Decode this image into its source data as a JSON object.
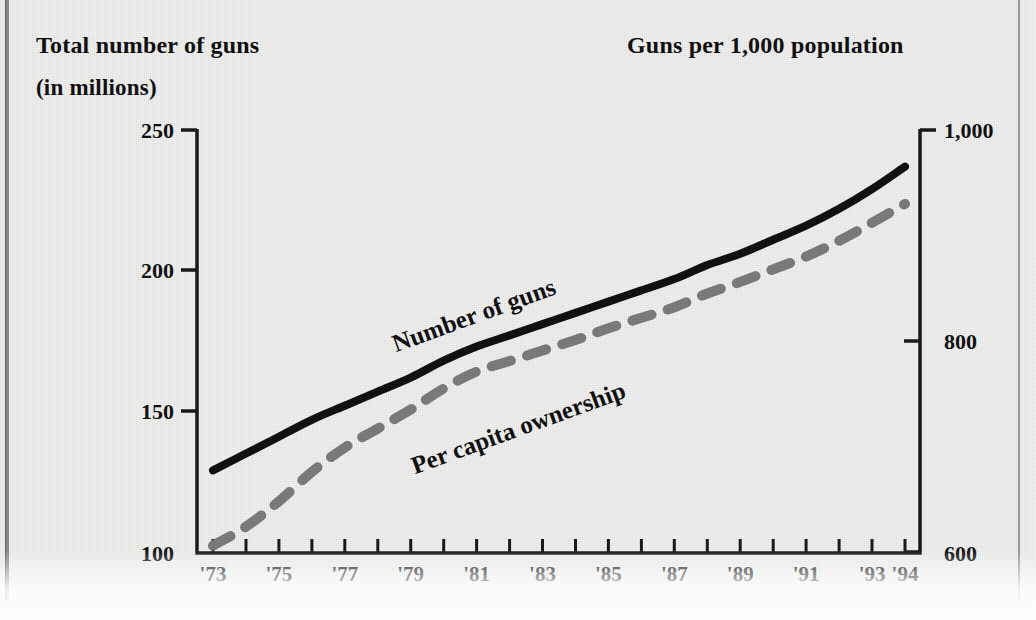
{
  "titles": {
    "left_line1": "Total number of guns",
    "left_line2": "(in millions)",
    "right": "Guns per 1,000 population"
  },
  "axes": {
    "left_ticks": [
      "250",
      "200",
      "150",
      "100"
    ],
    "right_ticks": [
      "1,000",
      "800",
      "600"
    ],
    "x_ticks": [
      "'73",
      "'75",
      "'77",
      "'79",
      "'81",
      "'83",
      "'85",
      "'87",
      "'89",
      "'91",
      "'93",
      "'94"
    ]
  },
  "series_labels": {
    "guns": "Number of guns",
    "per_capita": "Per capita ownership"
  },
  "colors": {
    "guns_line": "#111111",
    "per_capita_line": "#7d7d7d",
    "axis": "#1a1a1a",
    "background": "#f2f2f1"
  },
  "chart_data": {
    "type": "line",
    "xlabel": "",
    "ylabel": "Total number of guns (in millions)",
    "y2label": "Guns per 1,000 population",
    "grid": false,
    "legend": "inline-labels",
    "x": [
      1973,
      1974,
      1975,
      1976,
      1977,
      1978,
      1979,
      1980,
      1981,
      1982,
      1983,
      1984,
      1985,
      1986,
      1987,
      1988,
      1989,
      1990,
      1991,
      1992,
      1993,
      1994
    ],
    "tick_labels": [
      "'73",
      "'75",
      "'77",
      "'79",
      "'81",
      "'83",
      "'85",
      "'87",
      "'89",
      "'91",
      "'93",
      "'94"
    ],
    "ylim": [
      100,
      250
    ],
    "y2lim": [
      600,
      1000
    ],
    "series": [
      {
        "name": "Number of guns",
        "axis": "left",
        "style": "solid",
        "color": "#111111",
        "units": "millions",
        "values": [
          129,
          135,
          141,
          147,
          152,
          157,
          162,
          168,
          173,
          177,
          181,
          185,
          189,
          193,
          197,
          202,
          206,
          211,
          216,
          222,
          229,
          237
        ]
      },
      {
        "name": "Per capita ownership",
        "axis": "right",
        "style": "dashed",
        "color": "#7d7d7d",
        "units": "guns per 1,000 population",
        "values": [
          606,
          624,
          648,
          676,
          699,
          717,
          735,
          755,
          771,
          781,
          791,
          801,
          812,
          822,
          832,
          845,
          856,
          868,
          880,
          895,
          912,
          930
        ]
      }
    ]
  }
}
